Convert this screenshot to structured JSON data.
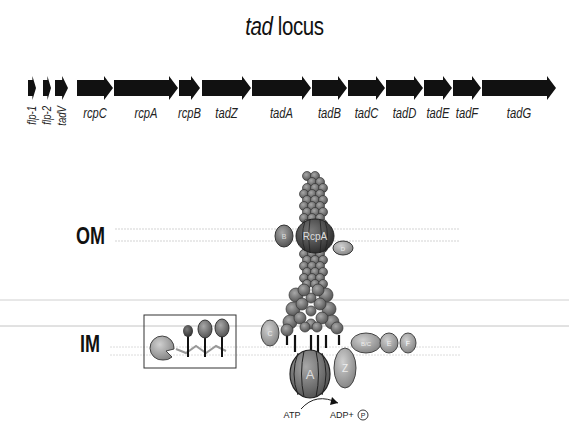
{
  "title": {
    "italic": "tad",
    "rest": " locus"
  },
  "genes": [
    {
      "name": "flp-1",
      "x1": 28,
      "x2": 36,
      "vertical": true
    },
    {
      "name": "flp-2",
      "x1": 43,
      "x2": 51,
      "vertical": true
    },
    {
      "name": "tadV",
      "x1": 55,
      "x2": 68,
      "vertical": true
    },
    {
      "name": "rcpC",
      "x1": 77,
      "x2": 113,
      "vertical": false
    },
    {
      "name": "rcpA",
      "x1": 114,
      "x2": 178,
      "vertical": false
    },
    {
      "name": "rcpB",
      "x1": 179,
      "x2": 200,
      "vertical": false
    },
    {
      "name": "tadZ",
      "x1": 202,
      "x2": 251,
      "vertical": false
    },
    {
      "name": "tadA",
      "x1": 252,
      "x2": 311,
      "vertical": false
    },
    {
      "name": "tadB",
      "x1": 312,
      "x2": 347,
      "vertical": false
    },
    {
      "name": "tadC",
      "x1": 348,
      "x2": 385,
      "vertical": false
    },
    {
      "name": "tadD",
      "x1": 386,
      "x2": 423,
      "vertical": false
    },
    {
      "name": "tadE",
      "x1": 424,
      "x2": 452,
      "vertical": false
    },
    {
      "name": "tadF",
      "x1": 453,
      "x2": 481,
      "vertical": false
    },
    {
      "name": "tadG",
      "x1": 482,
      "x2": 556,
      "vertical": false
    }
  ],
  "membranes": {
    "outer": "OM",
    "inner": "IM"
  },
  "proteins": {
    "secretin": "RcpA",
    "atpase": "A",
    "tadZ": "Z",
    "rcpC": "C",
    "rcpB": "B",
    "tadD": "D",
    "tadBC": "B/C",
    "tadE": "E",
    "tadF": "F"
  },
  "reaction": {
    "substrate": "ATP",
    "product": "ADP+",
    "phosphate": "P"
  },
  "colors": {
    "arrow": "#111111",
    "protein": "#777777",
    "protein_light": "#aaaaaa",
    "membrane": "#c8c8c8"
  }
}
